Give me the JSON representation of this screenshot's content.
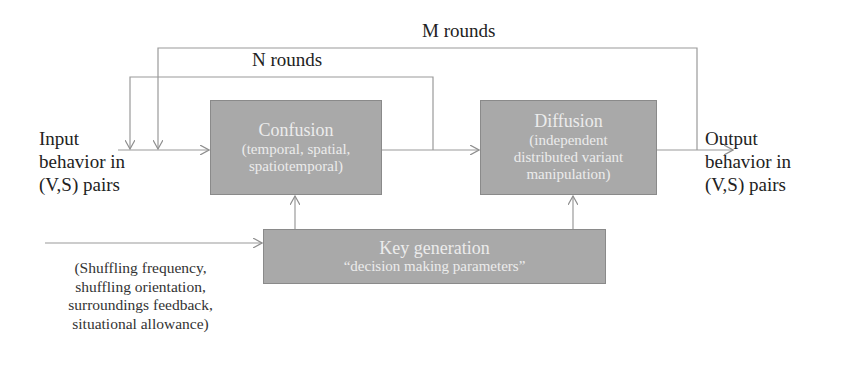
{
  "diagram": {
    "loops": {
      "outer": {
        "label": "M rounds"
      },
      "inner": {
        "label": "N rounds"
      }
    },
    "input": {
      "lines": [
        "Input",
        "behavior in",
        "(V,S) pairs"
      ]
    },
    "output": {
      "lines": [
        "Output",
        "behavior in",
        "(V,S) pairs"
      ]
    },
    "confusion": {
      "title": "Confusion",
      "sub_lines": [
        "(temporal, spatial,",
        "spatiotemporal)"
      ]
    },
    "diffusion": {
      "title": "Diffusion",
      "sub_lines": [
        "(independent",
        "distributed variant",
        "manipulation)"
      ]
    },
    "key_generation": {
      "title": "Key generation",
      "sub": "“decision making parameters”"
    },
    "key_inputs": {
      "lines": [
        "(Shuffling frequency,",
        "shuffling orientation,",
        "surroundings feedback,",
        "situational allowance)"
      ]
    },
    "colors": {
      "box_fill": "#a9a9a9",
      "box_text": "#ececec",
      "line": "#9a9a9a",
      "text": "#222222"
    }
  }
}
